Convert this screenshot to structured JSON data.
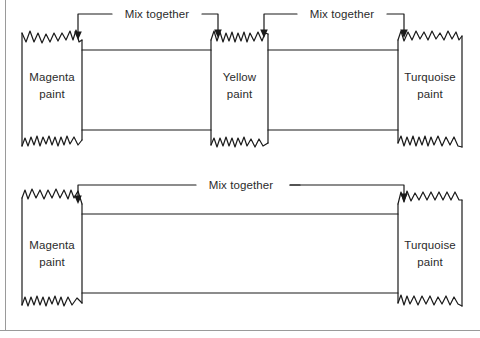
{
  "figure": {
    "background_color": "#ffffff",
    "ink_color": "#1a1a1a",
    "text_color": "#2b2b2b",
    "frame": {
      "left_rule": true,
      "bottom_rule": true
    }
  },
  "diagrams": [
    {
      "id": "three-paint-diagram",
      "name": "magenta-yellow-turquoise-mix",
      "paints": [
        {
          "id": "magenta",
          "label_line1": "Magenta",
          "label_line2": "paint"
        },
        {
          "id": "yellow",
          "label_line1": "Yellow",
          "label_line2": "paint"
        },
        {
          "id": "turquoise",
          "label_line1": "Turquoise",
          "label_line2": "paint"
        }
      ],
      "mix_labels": [
        {
          "id": "mix-left",
          "text": "Mix together"
        },
        {
          "id": "mix-right",
          "text": "Mix together"
        }
      ]
    },
    {
      "id": "two-paint-diagram",
      "name": "magenta-turquoise-mix",
      "paints": [
        {
          "id": "magenta",
          "label_line1": "Magenta",
          "label_line2": "paint"
        },
        {
          "id": "turquoise",
          "label_line1": "Turquoise",
          "label_line2": "paint"
        }
      ],
      "mix_labels": [
        {
          "id": "mix-wide",
          "text": "Mix together"
        }
      ]
    }
  ]
}
